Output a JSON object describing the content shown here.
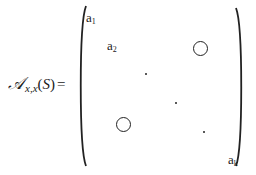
{
  "equation": {
    "lhs": {
      "symbol": "𝒜",
      "subscript": "x,x",
      "argument_open": "(",
      "argument": "S",
      "argument_close": ")",
      "equals": "="
    },
    "matrix": {
      "delimiter": "parentheses",
      "diagonal_entries": [
        {
          "base": "a",
          "index": "1"
        },
        {
          "base": "a",
          "index": "2"
        },
        {
          "base": "a",
          "index": "k"
        }
      ],
      "ellipsis_dots": 3,
      "off_diagonal_blocks": [
        {
          "position": "upper-right",
          "symbol": "O"
        },
        {
          "position": "lower-left",
          "symbol": "O"
        }
      ]
    }
  }
}
